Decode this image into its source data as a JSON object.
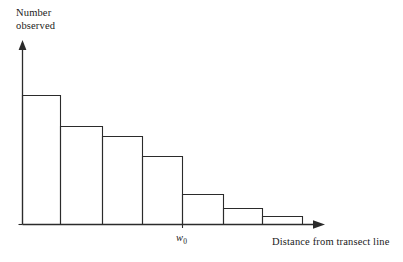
{
  "figure": {
    "title": "",
    "background_color": "#ffffff",
    "line_color": "#2b2b2b",
    "y_axis_label_line1": "Number",
    "y_axis_label_line2": "observed",
    "x_axis_label": "Distance from transect line",
    "x_tick_label": "w",
    "x_tick_label_subscript": "0"
  },
  "chart_data": {
    "type": "bar",
    "title": "",
    "xlabel": "Distance from transect line",
    "ylabel": "Number observed",
    "grid": false,
    "legend": false,
    "bar_style": "histogram-outline",
    "categories": [
      "bin1",
      "bin2",
      "bin3",
      "bin4",
      "bin5",
      "bin6",
      "bin7"
    ],
    "bin_edges_px": [
      22,
      60,
      102,
      142,
      182,
      223,
      262,
      302
    ],
    "bar_top_px": [
      95,
      126,
      136,
      156,
      194,
      208,
      216
    ],
    "values": [
      129,
      98,
      88,
      68,
      30,
      16,
      8
    ],
    "ylim": [
      0,
      182
    ],
    "xlim_px": [
      22,
      325
    ],
    "baseline_px": 224,
    "annotations": [
      {
        "label": "w",
        "subscript": "0",
        "x_px": 182,
        "note": "truncation distance tick on x-axis"
      }
    ],
    "axis_arrows": {
      "x": true,
      "y": true
    }
  }
}
